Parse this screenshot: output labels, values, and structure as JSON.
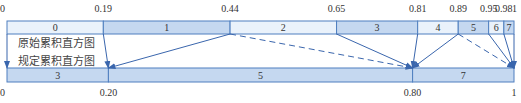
{
  "colors": {
    "border": "#4f7fbf",
    "dark_fill": "#c5d8f0",
    "light_fill": "#eaf2fb",
    "arrow": "#3a66ad",
    "text": "#333333"
  },
  "captions": {
    "original": "原始累积直方图",
    "specified": "规定累积直方图"
  },
  "top_bar": {
    "ticks": [
      {
        "value": 0,
        "label": "0"
      },
      {
        "value": 0.19,
        "label": "0.19"
      },
      {
        "value": 0.44,
        "label": "0.44"
      },
      {
        "value": 0.65,
        "label": "0.65"
      },
      {
        "value": 0.81,
        "label": "0.81"
      },
      {
        "value": 0.89,
        "label": "0.89"
      },
      {
        "value": 0.95,
        "label": "0.95"
      },
      {
        "value": 0.98,
        "label": "0.98"
      },
      {
        "value": 1,
        "label": "1"
      }
    ],
    "segments": [
      {
        "label": "0",
        "start": 0,
        "end": 0.19,
        "shade": "light"
      },
      {
        "label": "1",
        "start": 0.19,
        "end": 0.44,
        "shade": "dark"
      },
      {
        "label": "2",
        "start": 0.44,
        "end": 0.65,
        "shade": "light"
      },
      {
        "label": "3",
        "start": 0.65,
        "end": 0.81,
        "shade": "dark"
      },
      {
        "label": "4",
        "start": 0.81,
        "end": 0.89,
        "shade": "light"
      },
      {
        "label": "5",
        "start": 0.89,
        "end": 0.95,
        "shade": "dark"
      },
      {
        "label": "6",
        "start": 0.95,
        "end": 0.98,
        "shade": "light"
      },
      {
        "label": "7",
        "start": 0.98,
        "end": 1,
        "shade": "dark"
      }
    ]
  },
  "bottom_bar": {
    "ticks": [
      {
        "value": 0,
        "label": "0"
      },
      {
        "value": 0.2,
        "label": "0.20"
      },
      {
        "value": 0.8,
        "label": "0.80"
      },
      {
        "value": 1,
        "label": "1"
      }
    ],
    "segments": [
      {
        "label": "3",
        "start": 0,
        "end": 0.2
      },
      {
        "label": "5",
        "start": 0.2,
        "end": 0.8
      },
      {
        "label": "7",
        "start": 0.8,
        "end": 1
      }
    ]
  },
  "mappings": [
    {
      "from": 0,
      "to": 0,
      "style": "solid"
    },
    {
      "from": 0.19,
      "to": 0.2,
      "style": "solid"
    },
    {
      "from": 0.44,
      "to": 0.2,
      "style": "solid"
    },
    {
      "from": 0.44,
      "to": 0.8,
      "style": "dashed"
    },
    {
      "from": 0.65,
      "to": 0.8,
      "style": "solid"
    },
    {
      "from": 0.81,
      "to": 0.8,
      "style": "solid"
    },
    {
      "from": 0.89,
      "to": 0.8,
      "style": "solid"
    },
    {
      "from": 0.89,
      "to": 1,
      "style": "dashed"
    },
    {
      "from": 0.95,
      "to": 1,
      "style": "solid"
    },
    {
      "from": 0.98,
      "to": 1,
      "style": "solid"
    },
    {
      "from": 1,
      "to": 1,
      "style": "solid"
    }
  ]
}
